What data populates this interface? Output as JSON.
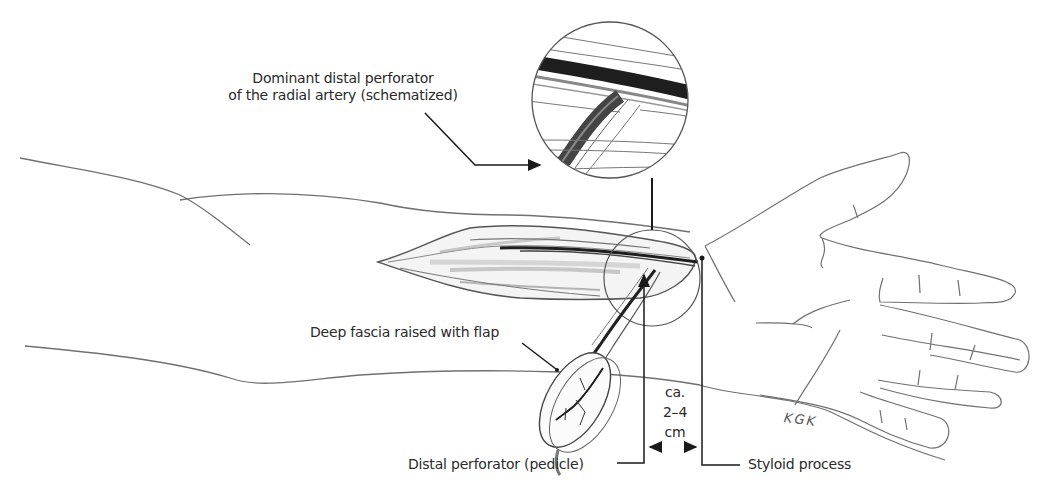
{
  "figure": {
    "labels": {
      "perforator_line1": "Dominant distal perforator",
      "perforator_line2": "of the radial artery (schematized)",
      "fascia": "Deep fascia raised with flap",
      "pedicle": "Distal perforator (pedicle)",
      "styloid": "Styloid process",
      "distance_line1": "ca.",
      "distance_line2": "2–4",
      "distance_line3": "cm"
    },
    "signature": "KGK",
    "colors": {
      "ink": "#2a2a2a",
      "sketch": "#6b6b6b",
      "shading": "#9a9a9a",
      "background": "#ffffff"
    }
  }
}
